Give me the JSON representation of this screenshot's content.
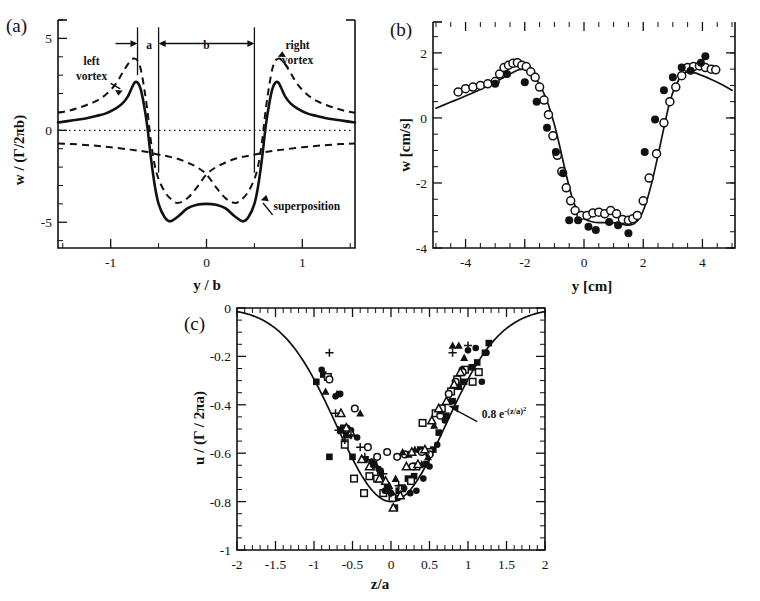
{
  "figure": {
    "panels": [
      "a",
      "b",
      "c"
    ]
  },
  "panel_a": {
    "letter": "(a)",
    "xlabel": "y / b",
    "ylabel": "w / (Γ/2πb)",
    "ytick_labels": [
      "5",
      "0",
      "-5"
    ],
    "xtick_labels": [
      "-1",
      "0",
      "1"
    ],
    "annotations": {
      "a_label": "a",
      "b_label": "b",
      "left_vortex_l1": "left",
      "left_vortex_l2": "vortex",
      "right_vortex_l1": "right",
      "right_vortex_l2": "vortex",
      "superposition": "superposition"
    }
  },
  "panel_b": {
    "letter": "(b)",
    "xlabel": "y [cm]",
    "ylabel": "w [cm/s]",
    "ytick_labels": [
      "2",
      "0",
      "-2",
      "-4"
    ],
    "xtick_labels": [
      "-4",
      "-2",
      "0",
      "2",
      "4"
    ]
  },
  "panel_c": {
    "letter": "(c)",
    "xlabel": "z/a",
    "ylabel": "u / (Γ / 2πa)",
    "ytick_labels": [
      "0",
      "-0.2",
      "-0.4",
      "-0.6",
      "-0.8",
      "-1"
    ],
    "xtick_labels": [
      "-2",
      "-1.5",
      "-1",
      "-0.5",
      "0",
      "0.5",
      "1",
      "1.5",
      "2"
    ],
    "fit_annotation_prefix": "0.8 e",
    "fit_annotation_exp": "-(z/a)",
    "fit_annotation_exp2": "2"
  },
  "chart_data": [
    {
      "type": "line",
      "panel": "a",
      "title": "",
      "xlabel": "y / b",
      "ylabel": "w / (Γ/2πb)",
      "xlim": [
        -1.55,
        1.55
      ],
      "ylim": [
        -6.4,
        6.0
      ],
      "grid": false,
      "yticks": [
        5,
        0,
        -5
      ],
      "xticks": [
        -1,
        0,
        1
      ],
      "annotations": [
        {
          "text": "left vortex",
          "x": -1.12,
          "y": 3.6
        },
        {
          "text": "right vortex",
          "x": 0.92,
          "y": 4.4
        },
        {
          "text": "superposition",
          "x": 0.72,
          "y": -4.3
        },
        {
          "text": "a",
          "x": -0.42,
          "y": 4.6
        },
        {
          "text": "b",
          "x": 0.0,
          "y": 4.6
        }
      ],
      "vertical_markers": [
        -0.72,
        -0.5,
        0.5
      ],
      "series": [
        {
          "name": "left vortex",
          "style": "dashed",
          "x": [
            -1.55,
            -1.45,
            -1.35,
            -1.25,
            -1.15,
            -1.05,
            -0.95,
            -0.88,
            -0.82,
            -0.78,
            -0.75,
            -0.72,
            -0.69,
            -0.66,
            -0.62,
            -0.58,
            -0.54,
            -0.5,
            -0.44,
            -0.38,
            -0.3,
            -0.2,
            -0.1,
            0.0,
            0.1,
            0.2,
            0.3,
            0.4,
            0.5,
            0.65,
            0.8,
            1.0,
            1.2,
            1.4,
            1.55
          ],
          "y": [
            0.95,
            1.05,
            1.2,
            1.38,
            1.6,
            1.95,
            2.5,
            3.1,
            3.6,
            3.85,
            3.9,
            3.8,
            3.4,
            2.6,
            1.2,
            -0.6,
            -1.9,
            -2.65,
            -3.3,
            -3.7,
            -3.95,
            -3.7,
            -3.1,
            -2.4,
            -2.0,
            -1.75,
            -1.55,
            -1.42,
            -1.32,
            -1.15,
            -1.05,
            -0.92,
            -0.82,
            -0.75,
            -0.72
          ]
        },
        {
          "name": "right vortex",
          "style": "dashed",
          "x": [
            -1.55,
            -1.4,
            -1.2,
            -1.0,
            -0.8,
            -0.65,
            -0.5,
            -0.4,
            -0.3,
            -0.2,
            -0.1,
            0.0,
            0.1,
            0.2,
            0.3,
            0.38,
            0.44,
            0.5,
            0.54,
            0.58,
            0.62,
            0.66,
            0.69,
            0.72,
            0.75,
            0.78,
            0.82,
            0.88,
            0.95,
            1.05,
            1.15,
            1.25,
            1.35,
            1.45,
            1.55
          ],
          "y": [
            -0.72,
            -0.75,
            -0.82,
            -0.92,
            -1.05,
            -1.15,
            -1.32,
            -1.42,
            -1.55,
            -1.75,
            -2.0,
            -2.4,
            -3.1,
            -3.7,
            -3.95,
            -3.7,
            -3.3,
            -2.65,
            -1.9,
            -0.6,
            1.2,
            2.6,
            3.4,
            3.8,
            3.9,
            3.85,
            3.6,
            3.1,
            2.5,
            1.95,
            1.6,
            1.38,
            1.2,
            1.05,
            0.95
          ]
        },
        {
          "name": "superposition",
          "style": "solid",
          "x": [
            -1.55,
            -1.45,
            -1.35,
            -1.25,
            -1.15,
            -1.05,
            -0.95,
            -0.88,
            -0.82,
            -0.78,
            -0.75,
            -0.72,
            -0.69,
            -0.66,
            -0.62,
            -0.58,
            -0.54,
            -0.5,
            -0.44,
            -0.38,
            -0.3,
            -0.2,
            -0.1,
            0.0,
            0.1,
            0.2,
            0.3,
            0.38,
            0.44,
            0.5,
            0.54,
            0.58,
            0.62,
            0.66,
            0.69,
            0.72,
            0.75,
            0.78,
            0.82,
            0.88,
            0.95,
            1.05,
            1.15,
            1.25,
            1.35,
            1.45,
            1.55
          ],
          "y": [
            0.43,
            0.5,
            0.58,
            0.66,
            0.78,
            0.92,
            1.18,
            1.45,
            1.85,
            2.3,
            2.6,
            2.6,
            2.3,
            1.6,
            0.3,
            -1.5,
            -3.0,
            -4.0,
            -4.7,
            -4.95,
            -4.7,
            -4.25,
            -4.05,
            -4.0,
            -4.05,
            -4.25,
            -4.7,
            -4.95,
            -4.7,
            -4.0,
            -3.0,
            -1.5,
            0.3,
            1.6,
            2.3,
            2.6,
            2.6,
            2.3,
            1.85,
            1.45,
            1.18,
            0.92,
            0.78,
            0.66,
            0.58,
            0.5,
            0.43
          ]
        }
      ]
    },
    {
      "type": "scatter",
      "panel": "b",
      "title": "",
      "xlabel": "y [cm]",
      "ylabel": "w [cm/s]",
      "xlim": [
        -5.1,
        5.1
      ],
      "ylim": [
        -4.0,
        2.95
      ],
      "grid": false,
      "yticks": [
        2,
        0,
        -2,
        -4
      ],
      "xticks": [
        -4,
        -2,
        0,
        2,
        4
      ],
      "series": [
        {
          "name": "model fit",
          "style": "solid",
          "x": [
            -5.0,
            -4.6,
            -4.2,
            -3.8,
            -3.4,
            -3.0,
            -2.7,
            -2.4,
            -2.2,
            -2.0,
            -1.8,
            -1.6,
            -1.4,
            -1.2,
            -1.0,
            -0.8,
            -0.6,
            -0.4,
            -0.2,
            0.0,
            0.3,
            0.6,
            0.9,
            1.2,
            1.5,
            1.7,
            1.9,
            2.1,
            2.3,
            2.5,
            2.7,
            2.9,
            3.1,
            3.3,
            3.5,
            3.7,
            4.0,
            4.3,
            4.6,
            5.0
          ],
          "y": [
            0.3,
            0.45,
            0.6,
            0.75,
            0.92,
            1.1,
            1.25,
            1.4,
            1.48,
            1.5,
            1.4,
            1.18,
            0.85,
            0.4,
            -0.2,
            -0.95,
            -1.75,
            -2.45,
            -2.9,
            -3.1,
            -3.2,
            -3.22,
            -3.22,
            -3.25,
            -3.3,
            -3.25,
            -3.05,
            -2.6,
            -1.95,
            -1.15,
            -0.3,
            0.5,
            1.0,
            1.3,
            1.42,
            1.4,
            1.3,
            1.18,
            1.05,
            0.85
          ]
        },
        {
          "name": "open circles",
          "marker": "open-circle",
          "x": [
            -4.25,
            -4.0,
            -3.75,
            -3.5,
            -3.25,
            -3.0,
            -2.85,
            -2.7,
            -2.55,
            -2.4,
            -2.25,
            -2.1,
            -1.95,
            -1.8,
            -1.65,
            -1.5,
            -1.35,
            -1.2,
            -1.05,
            -0.9,
            -0.75,
            -0.6,
            -0.45,
            -0.3,
            -0.1,
            0.1,
            0.3,
            0.5,
            0.7,
            0.9,
            1.1,
            1.3,
            1.5,
            1.65,
            1.8,
            2.0,
            2.2,
            2.45,
            2.7,
            2.9,
            3.1,
            3.3,
            3.5,
            3.7,
            3.9,
            4.1,
            4.3,
            4.45
          ],
          "y": [
            0.8,
            0.9,
            0.95,
            1.0,
            1.05,
            1.12,
            1.35,
            1.55,
            1.62,
            1.68,
            1.7,
            1.62,
            1.58,
            1.42,
            1.25,
            0.95,
            0.55,
            0.1,
            -0.55,
            -1.15,
            -1.65,
            -2.15,
            -2.55,
            -2.85,
            -3.0,
            -3.0,
            -2.92,
            -2.9,
            -2.95,
            -2.85,
            -2.95,
            -3.12,
            -3.15,
            -3.1,
            -3.0,
            -2.55,
            -1.85,
            -1.1,
            -0.15,
            0.5,
            0.95,
            1.3,
            1.55,
            1.58,
            1.6,
            1.55,
            1.5,
            1.48
          ]
        },
        {
          "name": "filled circles",
          "marker": "filled-circle",
          "x": [
            -3.0,
            -2.6,
            -2.0,
            -1.6,
            -1.25,
            -0.95,
            -0.7,
            -0.5,
            -0.2,
            0.15,
            0.4,
            0.85,
            1.15,
            1.5,
            2.05,
            2.4,
            2.7,
            3.0,
            3.3,
            3.6,
            3.95,
            4.1
          ],
          "y": [
            1.05,
            1.35,
            1.1,
            0.5,
            -0.3,
            -1.05,
            -1.7,
            -3.15,
            -3.15,
            -3.35,
            -3.45,
            -3.2,
            -3.3,
            -3.55,
            -1.05,
            -0.05,
            0.85,
            1.25,
            1.55,
            1.45,
            1.7,
            1.9
          ]
        }
      ]
    },
    {
      "type": "scatter",
      "panel": "c",
      "title": "",
      "xlabel": "z/a",
      "ylabel": "u / (Γ / 2πa)",
      "xlim": [
        -2.0,
        2.0
      ],
      "ylim": [
        -1.0,
        0.0
      ],
      "grid": false,
      "yticks": [
        0,
        -0.2,
        -0.4,
        -0.6,
        -0.8,
        -1
      ],
      "xticks": [
        -2,
        -1.5,
        -1,
        -0.5,
        0,
        0.5,
        1,
        1.5,
        2
      ],
      "fit_curve": {
        "formula": "0.8 e^{-(z/a)^2}",
        "amplitude": -0.8
      },
      "annotations": [
        {
          "text": "0.8 e^{-(z/a)^2}",
          "x": 1.15,
          "y": -0.43
        }
      ],
      "series": [
        {
          "name": "filled squares",
          "marker": "filled-square",
          "x": [
            -0.97,
            -0.88,
            -0.8,
            -0.66,
            -0.62,
            -0.58,
            -0.5,
            -0.34,
            -0.22,
            -0.14,
            -0.05,
            0.05,
            0.1,
            0.22,
            0.3,
            0.38,
            0.46,
            0.55,
            0.62,
            0.72,
            0.8,
            0.88,
            0.95,
            1.05,
            1.12,
            1.22,
            1.27
          ],
          "y": [
            -0.305,
            -0.275,
            -0.615,
            -0.505,
            -0.495,
            -0.525,
            -0.615,
            -0.625,
            -0.645,
            -0.675,
            -0.745,
            -0.825,
            -0.755,
            -0.705,
            -0.695,
            -0.585,
            -0.645,
            -0.585,
            -0.515,
            -0.445,
            -0.385,
            -0.325,
            -0.305,
            -0.245,
            -0.225,
            -0.185,
            -0.145
          ]
        },
        {
          "name": "open squares",
          "marker": "open-square",
          "x": [
            -0.82,
            -0.6,
            -0.48,
            -0.35,
            -0.28,
            -0.18,
            -0.1,
            0.02,
            0.14,
            0.26,
            0.33,
            0.41,
            0.5,
            0.58,
            0.66,
            0.78,
            0.86,
            0.96,
            1.06,
            1.14
          ],
          "y": [
            -0.285,
            -0.565,
            -0.705,
            -0.765,
            -0.695,
            -0.705,
            -0.765,
            -0.785,
            -0.745,
            -0.715,
            -0.655,
            -0.475,
            -0.595,
            -0.435,
            -0.415,
            -0.345,
            -0.295,
            -0.255,
            -0.305,
            -0.265
          ]
        },
        {
          "name": "filled circles",
          "marker": "filled-circle",
          "x": [
            -0.9,
            -0.72,
            -0.66,
            -0.57,
            -0.52,
            -0.44,
            -0.33,
            -0.25,
            -0.16,
            -0.08,
            0.0,
            0.09,
            0.17,
            0.25,
            0.33,
            0.42,
            0.5,
            0.6,
            0.7,
            0.78,
            0.86,
            0.92,
            1.0,
            1.1,
            1.18,
            1.24
          ],
          "y": [
            -0.255,
            -0.365,
            -0.355,
            -0.495,
            -0.505,
            -0.535,
            -0.625,
            -0.635,
            -0.665,
            -0.755,
            -0.765,
            -0.785,
            -0.745,
            -0.765,
            -0.755,
            -0.705,
            -0.655,
            -0.565,
            -0.465,
            -0.385,
            -0.325,
            -0.255,
            -0.175,
            -0.165,
            -0.305,
            -0.185
          ]
        },
        {
          "name": "open circles",
          "marker": "open-circle",
          "x": [
            -0.8,
            -0.47,
            -0.3,
            -0.18,
            -0.05,
            0.08,
            0.18,
            0.28,
            0.4,
            0.5,
            0.64,
            0.75,
            0.84,
            0.93
          ],
          "y": [
            -0.295,
            -0.415,
            -0.575,
            -0.615,
            -0.595,
            -0.615,
            -0.605,
            -0.655,
            -0.595,
            -0.605,
            -0.445,
            -0.355,
            -0.305,
            -0.265
          ]
        },
        {
          "name": "filled triangles",
          "marker": "filled-triangle",
          "x": [
            -0.85,
            -0.7,
            -0.63,
            -0.55,
            -0.4,
            -0.34,
            -0.2,
            -0.12,
            -0.02,
            0.06,
            0.15,
            0.23,
            0.31,
            0.4,
            0.48,
            0.56,
            0.64,
            0.72,
            0.8,
            0.88,
            0.95
          ],
          "y": [
            -0.345,
            -0.355,
            -0.505,
            -0.525,
            -0.435,
            -0.625,
            -0.645,
            -0.695,
            -0.735,
            -0.705,
            -0.595,
            -0.605,
            -0.585,
            -0.645,
            -0.615,
            -0.485,
            -0.425,
            -0.385,
            -0.155,
            -0.155,
            -0.205
          ]
        },
        {
          "name": "open triangles",
          "marker": "open-triangle",
          "x": [
            -0.65,
            -0.58,
            -0.52,
            -0.38,
            -0.28,
            -0.15,
            -0.07,
            0.03,
            0.12,
            0.2,
            0.27,
            0.35,
            0.44,
            0.53,
            0.62,
            0.72,
            0.82,
            0.9
          ],
          "y": [
            -0.435,
            -0.495,
            -0.515,
            -0.625,
            -0.655,
            -0.705,
            -0.715,
            -0.825,
            -0.775,
            -0.655,
            -0.595,
            -0.645,
            -0.585,
            -0.465,
            -0.415,
            -0.385,
            -0.315,
            -0.265
          ]
        },
        {
          "name": "plus markers",
          "marker": "plus",
          "x": [
            -0.8,
            -0.72,
            -0.68,
            -0.6,
            -0.52,
            -0.4,
            -0.34,
            -0.22,
            -0.1,
            0.0,
            0.1,
            0.8,
            1.0
          ],
          "y": [
            -0.185,
            -0.435,
            -0.505,
            -0.545,
            -0.525,
            -0.575,
            -0.615,
            -0.655,
            -0.685,
            -0.765,
            -0.735,
            -0.185,
            -0.155
          ]
        }
      ]
    }
  ]
}
